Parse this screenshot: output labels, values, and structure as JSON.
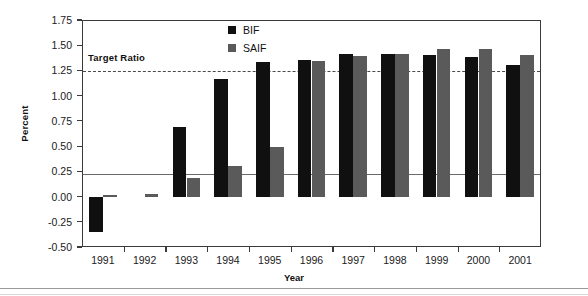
{
  "chart_data": {
    "type": "bar",
    "title": "",
    "xlabel": "Year",
    "ylabel": "Percent",
    "categories": [
      "1991",
      "1992",
      "1993",
      "1994",
      "1995",
      "1996",
      "1997",
      "1998",
      "1999",
      "2000",
      "2001"
    ],
    "series": [
      {
        "name": "BIF",
        "color": "#101010",
        "values": [
          -0.35,
          0.0,
          0.69,
          1.17,
          1.33,
          1.35,
          1.41,
          1.41,
          1.4,
          1.38,
          1.3
        ]
      },
      {
        "name": "SAIF",
        "color": "#5a5a5a",
        "values": [
          0.02,
          0.03,
          0.18,
          0.3,
          0.49,
          1.34,
          1.39,
          1.41,
          1.46,
          1.46,
          1.4
        ]
      }
    ],
    "ylim": [
      -0.5,
      1.75
    ],
    "yticks": [
      "1.75",
      "1.50",
      "1.25",
      "1.00",
      "0.75",
      "0.50",
      "0.25",
      "0.00",
      "-0.25",
      "-0.50"
    ],
    "ytick_values": [
      1.75,
      1.5,
      1.25,
      1.0,
      0.75,
      0.5,
      0.25,
      0.0,
      -0.25,
      -0.5
    ],
    "grid": false,
    "legend_position": "top-center",
    "annotations": [
      {
        "name": "target-ratio",
        "label": "Target Ratio",
        "value": 1.25,
        "style": "dashed-horizontal-line"
      }
    ]
  },
  "legend": {
    "items": [
      {
        "label": "BIF",
        "color": "#101010"
      },
      {
        "label": "SAIF",
        "color": "#5a5a5a"
      }
    ]
  },
  "axes": {
    "y_title": "Percent",
    "x_title": "Year"
  },
  "colors": {
    "bif": "#101010",
    "saif": "#5a5a5a",
    "axis": "#3a3a3a",
    "target_line": "#4a4a4a",
    "background": "#ffffff"
  }
}
